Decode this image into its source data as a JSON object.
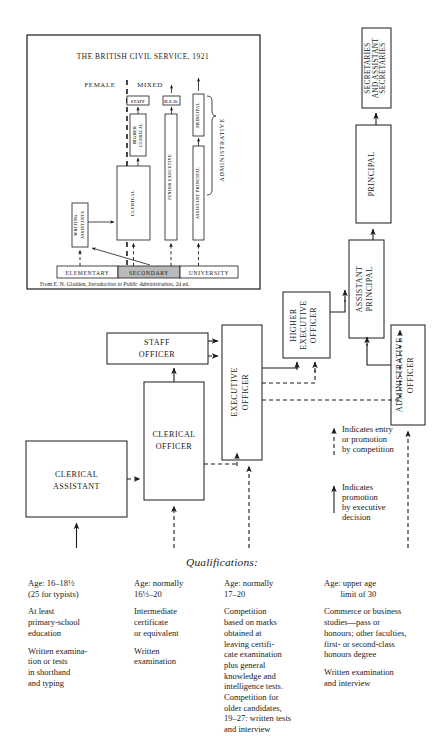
{
  "inset": {
    "title": "THE BRITISH CIVIL SERVICE, 1921",
    "female_label": "FEMALE",
    "mixed_label": "MIXED",
    "administrative_label": "ADMINISTRATIVE",
    "boxes": {
      "staff": "STAFF",
      "higher_clerical_1": "HIGHER",
      "higher_clerical_2": "CLERICAL",
      "clerical": "CLERICAL",
      "heo": "H.E.O.",
      "junior_executive": "JUNIOR  EXECUTIVE",
      "principal": "PRINCIPAL",
      "assistant_principal": "ASSISTANT PRINCIPAL",
      "writing_assistants_1": "WRITING",
      "writing_assistants_2": "ASSISTANTS"
    },
    "education": {
      "elementary": "ELEMENTARY",
      "secondary": "SECONDARY",
      "university": "UNIVERSITY"
    },
    "citation": {
      "before": "From E. N. Gladden, ",
      "italic": "Introduction to Public Administration",
      "after": ", 2d ed."
    }
  },
  "main": {
    "boxes": {
      "clerical_assistant_1": "CLERICAL",
      "clerical_assistant_2": "ASSISTANT",
      "clerical_officer_1": "CLERICAL",
      "clerical_officer_2": "OFFICER",
      "staff_officer_1": "STAFF",
      "staff_officer_2": "OFFICER",
      "executive_officer_1": "EXECUTIVE",
      "executive_officer_2": "OFFICER",
      "higher_executive_officer_1": "HIGHER",
      "higher_executive_officer_2": "EXECUTIVE",
      "higher_executive_officer_3": "OFFICER",
      "administrative_officer_1": "ADMINISTRATIVE",
      "administrative_officer_2": "OFFICER",
      "assistant_principal_1": "ASSISTANT",
      "assistant_principal_2": "PRINCIPAL",
      "principal": "PRINCIPAL",
      "secretaries_1": "SECRETARIES",
      "secretaries_2": "AND ASSISTANT",
      "secretaries_3": "SECRETARIES"
    }
  },
  "legend": {
    "competition": "Indicates entry\nor promotion\nby competition",
    "executive": "Indicates\npromotion\nby executive\ndecision"
  },
  "qualifications": {
    "title": "Qualifications:",
    "columns": [
      {
        "paragraphs": [
          "Age: 16–18½\n(25 for typists)",
          "At least\nprimary-school\neducation",
          "Written examina-\ntion or tests\nin shorthand\nand typing"
        ]
      },
      {
        "paragraphs": [
          "Age: normally\n16½–20",
          "Intermediate\ncertificate\nor equivalent",
          "Written\nexamination"
        ]
      },
      {
        "paragraphs": [
          "Age: normally\n17–20",
          "Competition\nbased on marks\nobtained at\nleaving certifi-\ncate examination\nplus general\nknowledge and\nintelligence tests.\nCompetition for\nolder candidates,\n19–27: written tests\nand interview"
        ]
      },
      {
        "paragraphs": [
          "Age: upper age\n    limit of 30",
          "Commerce or business\nstudies—pass or\nhonours; other faculties,\nfirst- or second-class\nhonours degree",
          "Written examination\nand interview"
        ]
      }
    ]
  },
  "colors": {
    "ink": "#1a1a1a",
    "paper": "#ffffff",
    "shade": "#b9b9b9"
  }
}
